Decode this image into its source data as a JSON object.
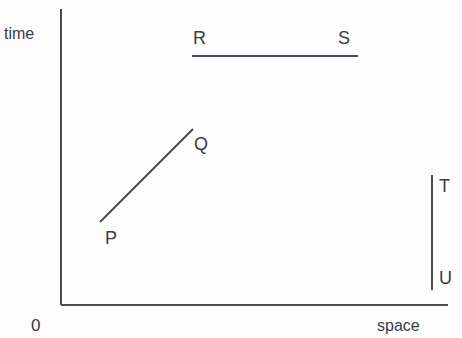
{
  "figure": {
    "type": "spacetime-diagram",
    "background_color": "#fdfdfd",
    "line_color": "#4a4a58",
    "text_color": "#3b3b45"
  },
  "axes": {
    "y_axis_label": "time",
    "x_axis_label": "space",
    "origin_label": "0",
    "x_axis": {
      "start_px": [
        61,
        305
      ],
      "end_px": [
        448,
        305
      ]
    },
    "y_axis": {
      "start_px": [
        61,
        9
      ],
      "end_px": [
        61,
        305
      ]
    }
  },
  "segments": [
    {
      "name": "RS",
      "orientation": "horizontal",
      "start_label": "R",
      "end_label": "S",
      "start_px": [
        192,
        56
      ],
      "end_px": [
        358,
        56
      ]
    },
    {
      "name": "PQ",
      "orientation": "diagonal",
      "start_label": "P",
      "end_label": "Q",
      "start_px": [
        100,
        222
      ],
      "end_px": [
        193,
        129
      ]
    },
    {
      "name": "TU",
      "orientation": "vertical",
      "start_label": "T",
      "end_label": "U",
      "start_px": [
        432,
        175
      ],
      "end_px": [
        432,
        290
      ]
    }
  ],
  "labels": {
    "time": "time",
    "space": "space",
    "origin": "0",
    "R": "R",
    "S": "S",
    "P": "P",
    "Q": "Q",
    "T": "T",
    "U": "U"
  },
  "chart_data": {
    "type": "line",
    "title": "",
    "xlabel": "space",
    "ylabel": "time",
    "grid": false,
    "legend": "none",
    "origin": "0",
    "series": [
      {
        "name": "RS",
        "annotations": [
          "R",
          "S"
        ],
        "description": "horizontal segment (constant time, extended in space)",
        "points_px": [
          [
            192,
            56
          ],
          [
            358,
            56
          ]
        ]
      },
      {
        "name": "PQ",
        "annotations": [
          "P",
          "Q"
        ],
        "description": "diagonal segment rising left-to-right (moving worldline)",
        "points_px": [
          [
            100,
            222
          ],
          [
            193,
            129
          ]
        ]
      },
      {
        "name": "TU",
        "annotations": [
          "T",
          "U"
        ],
        "description": "vertical segment (constant space, extended in time)",
        "points_px": [
          [
            432,
            175
          ],
          [
            432,
            290
          ]
        ]
      }
    ]
  }
}
